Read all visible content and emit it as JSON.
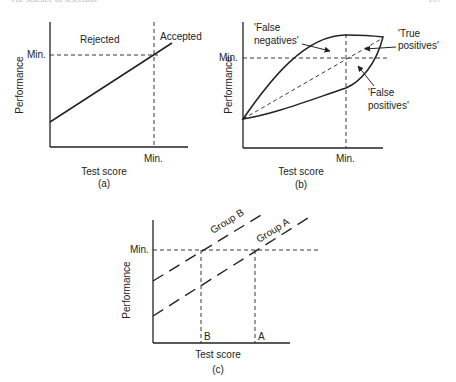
{
  "page": {
    "running_header": "The science of selection",
    "page_number": "107"
  },
  "panel_a": {
    "caption": "(a)",
    "xlabel": "Test score",
    "ylabel": "Performance",
    "y_min_label": "Min.",
    "x_min_label": "Min.",
    "region_left": "Rejected",
    "region_right": "Accepted"
  },
  "panel_b": {
    "caption": "(b)",
    "xlabel": "Test score",
    "ylabel": "Performance",
    "y_min_label": "Min.",
    "x_min_label": "Min.",
    "false_negatives_line1": "'False",
    "false_negatives_line2": "negatives'",
    "true_positives_line1": "'True",
    "true_positives_line2": "positives'",
    "false_positives_line1": "'False",
    "false_positives_line2": "positives'"
  },
  "panel_c": {
    "caption": "(c)",
    "xlabel": "Test score",
    "ylabel": "Performance",
    "y_min_label": "Min.",
    "x_label_b": "B",
    "x_label_a": "A",
    "group_b": "Group B",
    "group_a": "Group A"
  },
  "colors": {
    "ink": "#222222",
    "background": "#ffffff"
  }
}
